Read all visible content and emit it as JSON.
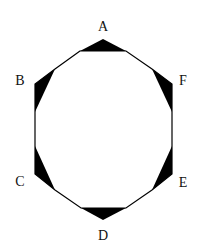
{
  "diagram": {
    "type": "octagon-with-shaded-corner-triangles",
    "stroke_color": "#000000",
    "fill_color": "#000000",
    "background": "#ffffff",
    "outline_points": [
      [
        80,
        51
      ],
      [
        55,
        69
      ],
      [
        35,
        84
      ],
      [
        35,
        174
      ],
      [
        55,
        190
      ],
      [
        81,
        208
      ],
      [
        126,
        208
      ],
      [
        152,
        190
      ],
      [
        172,
        174
      ],
      [
        172,
        84
      ],
      [
        152,
        69
      ],
      [
        126,
        51
      ]
    ],
    "triangles": [
      {
        "id": "A",
        "points": "80,51 103,39 126,51"
      },
      {
        "id": "B",
        "points": "55,69 35,84 35,112"
      },
      {
        "id": "C",
        "points": "35,146 35,174 55,190"
      },
      {
        "id": "D",
        "points": "81,208 103,220 126,208"
      },
      {
        "id": "E",
        "points": "152,190 172,174 172,146"
      },
      {
        "id": "F",
        "points": "152,69 172,84 172,112"
      }
    ],
    "labels": [
      {
        "id": "A",
        "text": "A",
        "x": 103,
        "y": 31
      },
      {
        "id": "B",
        "text": "B",
        "x": 20,
        "y": 85
      },
      {
        "id": "C",
        "text": "C",
        "x": 20,
        "y": 186
      },
      {
        "id": "D",
        "text": "D",
        "x": 103,
        "y": 240
      },
      {
        "id": "E",
        "text": "E",
        "x": 183,
        "y": 187
      },
      {
        "id": "F",
        "text": "F",
        "x": 183,
        "y": 85
      }
    ]
  }
}
